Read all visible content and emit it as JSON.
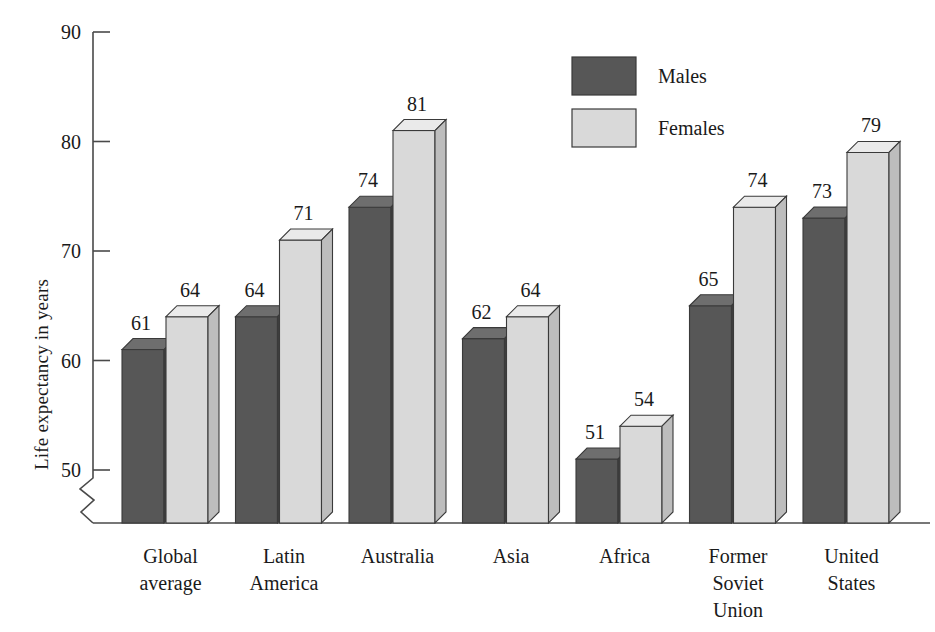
{
  "chart_data": {
    "type": "bar",
    "title": "",
    "xlabel": "",
    "ylabel": "Life expectancy in years",
    "ylim": [
      46,
      90
    ],
    "yticks": [
      50,
      60,
      70,
      80,
      90
    ],
    "ytick_labels": [
      "50",
      "60",
      "70",
      "80",
      "90"
    ],
    "axis_break": true,
    "grid": false,
    "legend_position": "top-right",
    "categories": [
      "Global average",
      "Latin America",
      "Australia",
      "Asia",
      "Africa",
      "Former Soviet Union",
      "United States"
    ],
    "category_label_lines": [
      [
        "Global",
        "average"
      ],
      [
        "Latin",
        "America"
      ],
      [
        "Australia"
      ],
      [
        "Asia"
      ],
      [
        "Africa"
      ],
      [
        "Former",
        "Soviet",
        "Union"
      ],
      [
        "United",
        "States"
      ]
    ],
    "series": [
      {
        "name": "Males",
        "color": "#575757",
        "values": [
          61,
          64,
          74,
          62,
          51,
          65,
          73
        ]
      },
      {
        "name": "Females",
        "color": "#d9d9d9",
        "values": [
          64,
          71,
          81,
          64,
          54,
          74,
          79
        ]
      }
    ]
  },
  "legend": {
    "items": [
      {
        "label": "Males",
        "color": "#575757"
      },
      {
        "label": "Females",
        "color": "#d9d9d9"
      }
    ]
  },
  "axis": {
    "y_title": "Life expectancy in years"
  },
  "colors": {
    "males_front": "#575757",
    "males_top": "#6e6e6e",
    "males_side": "#3f3f3f",
    "females_front": "#d9d9d9",
    "females_top": "#eaeaea",
    "females_side": "#bdbdbd",
    "axis": "#4a4a4a",
    "text": "#1a1a1a",
    "background": "#ffffff"
  }
}
